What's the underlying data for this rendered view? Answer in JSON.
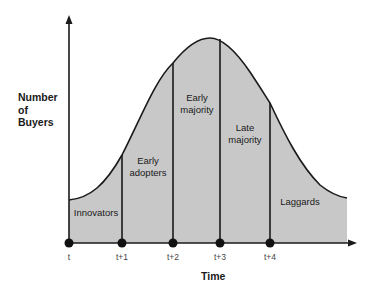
{
  "diagram": {
    "y_axis_label": "Number of Buyers",
    "y_axis_lines": [
      "Number",
      "of",
      "Buyers"
    ],
    "x_axis_label": "Time",
    "ticks": [
      "t",
      "t+1",
      "t+2",
      "t+3",
      "t+4"
    ],
    "segments": [
      {
        "name": "Innovators",
        "lines": [
          "Innovators"
        ]
      },
      {
        "name": "Early adopters",
        "lines": [
          "Early",
          "adopters"
        ]
      },
      {
        "name": "Early majority",
        "lines": [
          "Early",
          "majority"
        ]
      },
      {
        "name": "Late majority",
        "lines": [
          "Late",
          "majority"
        ]
      },
      {
        "name": "Laggards",
        "lines": [
          "Laggards"
        ]
      }
    ],
    "colors": {
      "fill": "#c8c8c8",
      "line": "#1a1a1a",
      "background": "#ffffff"
    }
  }
}
